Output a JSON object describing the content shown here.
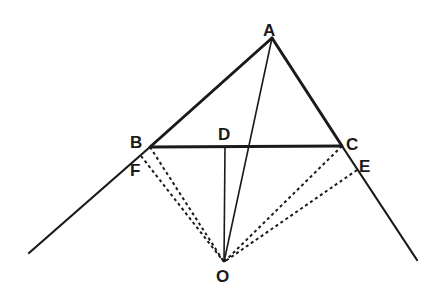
{
  "diagram": {
    "type": "geometry-construction",
    "stroke_color": "#1a1a1a",
    "points": {
      "A": {
        "label": "A",
        "x": 272,
        "y": 38,
        "lx": 263,
        "ly": 36
      },
      "B": {
        "label": "B",
        "x": 150,
        "y": 147,
        "lx": 130,
        "ly": 148
      },
      "C": {
        "label": "C",
        "x": 342,
        "y": 146,
        "lx": 346,
        "ly": 150
      },
      "D": {
        "label": "D",
        "x": 225,
        "y": 147,
        "lx": 218,
        "ly": 140
      },
      "E": {
        "label": "E",
        "x": 357,
        "y": 170,
        "lx": 359,
        "ly": 172
      },
      "F": {
        "label": "F",
        "x": 141,
        "y": 156,
        "lx": 130,
        "ly": 176
      },
      "O": {
        "label": "O",
        "x": 224,
        "y": 262,
        "lx": 216,
        "ly": 282
      }
    },
    "lines": [
      {
        "name": "side-ab-extended",
        "from": "A",
        "to": "left-end",
        "style": "solid-thick"
      },
      {
        "name": "side-ac-extended",
        "from": "A",
        "to": "right-end",
        "style": "solid-thick"
      },
      {
        "name": "side-bc",
        "from": "B",
        "to": "C",
        "style": "solid-thick"
      },
      {
        "name": "segment-ao",
        "from": "A",
        "to": "O",
        "style": "solid-thin"
      },
      {
        "name": "segment-do",
        "from": "D",
        "to": "O",
        "style": "solid-thin"
      },
      {
        "name": "segment-bo",
        "from": "B",
        "to": "O",
        "style": "dashed"
      },
      {
        "name": "segment-fo",
        "from": "F",
        "to": "O",
        "style": "dashed"
      },
      {
        "name": "segment-co",
        "from": "C",
        "to": "O",
        "style": "dashed"
      },
      {
        "name": "segment-eo",
        "from": "E",
        "to": "O",
        "style": "dashed"
      }
    ],
    "endpoints": {
      "left-end": {
        "x": 29,
        "y": 253
      },
      "right-end": {
        "x": 417,
        "y": 260
      }
    }
  }
}
